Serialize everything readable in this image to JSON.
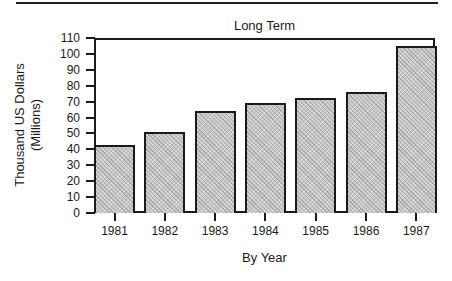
{
  "chart_data": {
    "type": "bar",
    "title": "Long Term",
    "xlabel": "By Year",
    "ylabel": "Thousand US Dollars (Millions)",
    "ylabel_lines": [
      "Thousand US Dollars",
      "(Millions)"
    ],
    "categories": [
      "1981",
      "1982",
      "1983",
      "1984",
      "1985",
      "1986",
      "1987"
    ],
    "values": [
      43,
      51,
      64,
      69,
      72,
      76,
      105
    ],
    "ylim": [
      0,
      110
    ],
    "yticks": [
      0,
      10,
      20,
      30,
      40,
      50,
      60,
      70,
      80,
      90,
      100,
      110
    ],
    "grid": false,
    "legend": null,
    "bar_fill": "#c9c9c9",
    "bar_fill_pattern": "dithered gray",
    "outline_color": "#1a1a1a"
  }
}
